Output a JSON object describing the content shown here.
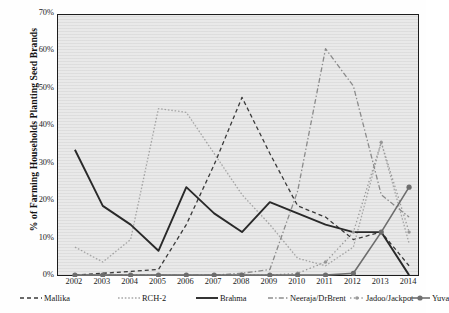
{
  "chart_data": {
    "type": "line",
    "title": "",
    "xlabel": "",
    "ylabel": "% of Farming Households Planting Seed Brands",
    "ylim": [
      0,
      70
    ],
    "ytick_labels": [
      "0%",
      "10%",
      "20%",
      "30%",
      "40%",
      "50%",
      "60%",
      "70%"
    ],
    "ytick_values": [
      0,
      10,
      20,
      30,
      40,
      50,
      60,
      70
    ],
    "grid": false,
    "legend_position": "bottom",
    "categories": [
      "2002",
      "2003",
      "2004",
      "2005",
      "2006",
      "2007",
      "2008",
      "2009",
      "2010",
      "2011",
      "2012",
      "2013",
      "2014"
    ],
    "x": [
      2002,
      2003,
      2004,
      2005,
      2006,
      2007,
      2008,
      2009,
      2010,
      2011,
      2012,
      2013,
      2014
    ],
    "series": [
      {
        "name": "Mallika",
        "style": "dashed",
        "color": "#3a3a3a",
        "marker": "none",
        "values": [
          0.5,
          1,
          1.5,
          2,
          14,
          30,
          48,
          33,
          19,
          16,
          10,
          12,
          3
        ]
      },
      {
        "name": "RCH-2",
        "style": "dotted",
        "color": "#a8a8a8",
        "marker": "none",
        "values": [
          8,
          4,
          10,
          45,
          44,
          33,
          22,
          14,
          5,
          3,
          8,
          36,
          9
        ]
      },
      {
        "name": "Brahma",
        "style": "solid",
        "color": "#2a2a2a",
        "marker": "none",
        "values": [
          34,
          19,
          14,
          7,
          24,
          17,
          12,
          20,
          17,
          14,
          12,
          12,
          0.5
        ]
      },
      {
        "name": "Neeraja/DrBrent",
        "style": "dash-dot",
        "color": "#8d8d8d",
        "marker": "none",
        "values": [
          0.5,
          0.5,
          0.5,
          0.5,
          0.5,
          0.5,
          1,
          2,
          23,
          61,
          51,
          22,
          16
        ]
      },
      {
        "name": "Jadoo/Jackpot",
        "style": "dotted-marker",
        "color": "#9a9a9a",
        "marker": "dot",
        "values": [
          0.5,
          0.5,
          0.5,
          0.5,
          0.5,
          0.5,
          0.5,
          0.5,
          1,
          4,
          12,
          36,
          12
        ]
      },
      {
        "name": "Yuva",
        "style": "solid-marker",
        "color": "#6f6f6f",
        "marker": "circle",
        "values": [
          0.5,
          0.5,
          0.5,
          0.5,
          0.5,
          0.5,
          0.5,
          0.5,
          0.5,
          0.5,
          1,
          12,
          24
        ]
      }
    ]
  },
  "legend": {
    "items": [
      {
        "label": "Mallika"
      },
      {
        "label": "RCH-2"
      },
      {
        "label": "Brahma"
      },
      {
        "label": "Neeraja/DrBrent"
      },
      {
        "label": "Jadoo/Jackpot"
      },
      {
        "label": "Yuva"
      }
    ]
  }
}
